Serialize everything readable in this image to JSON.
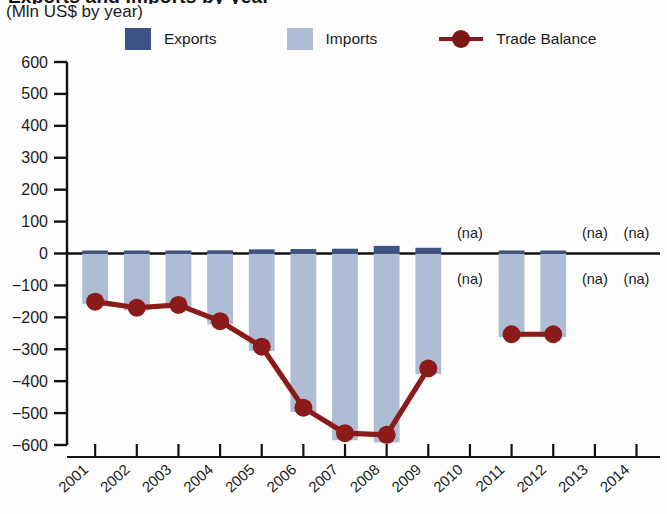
{
  "header": {
    "title_cut": "Exports and Imports by year",
    "subtitle": "(Mln US$ by year)"
  },
  "legend": {
    "position": "top",
    "items": [
      {
        "label": "Exports",
        "type": "bar",
        "color": "#3e5283",
        "icon": "square-swatch-icon"
      },
      {
        "label": "Imports",
        "type": "bar",
        "color": "#aebcd4",
        "icon": "square-swatch-icon"
      },
      {
        "label": "Trade Balance",
        "type": "line",
        "color": "#8b1a1a",
        "icon": "line-marker-icon"
      }
    ]
  },
  "axes": {
    "y": {
      "label": "",
      "min": -600,
      "max": 600,
      "step": 100,
      "ticks": [
        "600",
        "500",
        "400",
        "300",
        "200",
        "100",
        "0",
        "−100",
        "−200",
        "−300",
        "−400",
        "−500",
        "−600"
      ]
    },
    "x": {
      "label": "",
      "ticks": [
        "2001",
        "2002",
        "2003",
        "2004",
        "2005",
        "2006",
        "2007",
        "2008",
        "2009",
        "2010",
        "2011",
        "2012",
        "2013",
        "2014"
      ]
    },
    "grid": false
  },
  "annotations": {
    "na_text": "(na)",
    "na_years": [
      "2010",
      "2013",
      "2014"
    ],
    "na_positions": [
      "above-axis",
      "below-axis"
    ]
  },
  "chart_data": {
    "type": "bar",
    "title": "Exports and Imports by year",
    "subtitle": "(Mln US$ by year)",
    "xlabel": "",
    "ylabel": "Mln US$",
    "ylim": [
      -600,
      600
    ],
    "grid": false,
    "legend_position": "top",
    "categories": [
      "2001",
      "2002",
      "2003",
      "2004",
      "2005",
      "2006",
      "2007",
      "2008",
      "2009",
      "2010",
      "2011",
      "2012",
      "2013",
      "2014"
    ],
    "series": [
      {
        "name": "Exports",
        "type": "bar",
        "color": "#3e5283",
        "values": [
          7,
          8,
          9,
          10,
          13,
          14,
          15,
          24,
          18,
          null,
          6,
          9,
          null,
          null
        ]
      },
      {
        "name": "Imports",
        "type": "bar",
        "color": "#aebcd4",
        "values": [
          -158,
          -178,
          -170,
          -222,
          -305,
          -497,
          -585,
          -592,
          -378,
          null,
          -262,
          -262,
          null,
          null
        ]
      },
      {
        "name": "Trade Balance",
        "type": "line",
        "color": "#8b1a1a",
        "values": [
          -151,
          -170,
          -161,
          -212,
          -292,
          -483,
          -563,
          -568,
          -360,
          null,
          -253,
          -253,
          null,
          null
        ]
      }
    ]
  }
}
